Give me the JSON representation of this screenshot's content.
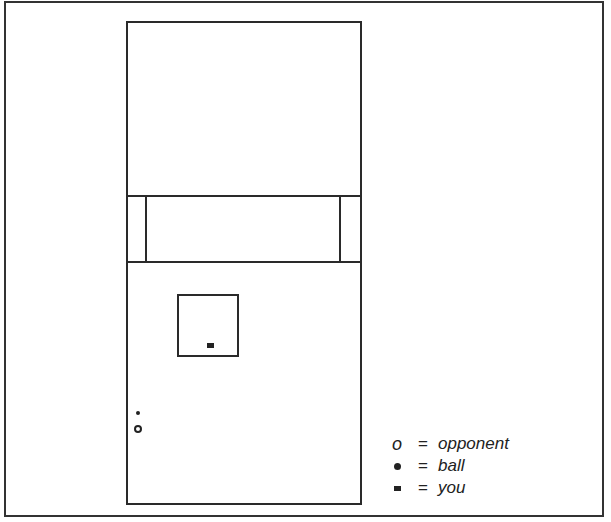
{
  "diagram": {
    "type": "squash-court-top-view",
    "legend": [
      {
        "symbol": "o",
        "equals": "=",
        "label": "opponent"
      },
      {
        "symbol": "•",
        "equals": "=",
        "label": "ball"
      },
      {
        "symbol": "▬",
        "equals": "=",
        "label": "you"
      }
    ]
  }
}
